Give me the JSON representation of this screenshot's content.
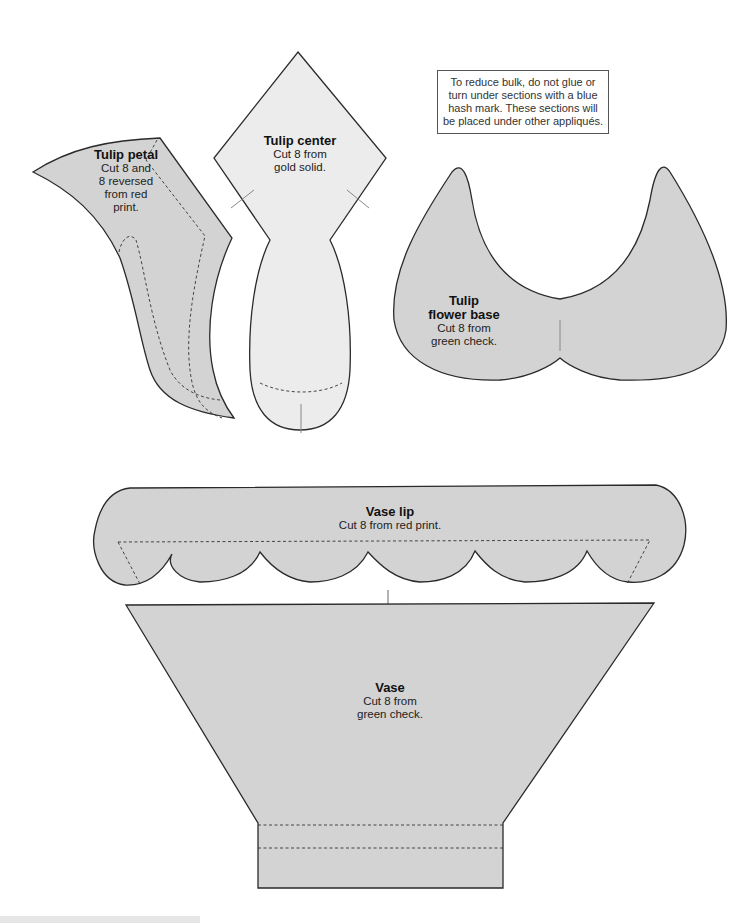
{
  "note": {
    "text": "To reduce bulk, do not glue or turn under sections with a blue hash mark. These sections will be placed under other appliqués."
  },
  "pieces": {
    "tulip_petal": {
      "title": "Tulip petal",
      "line1": "Cut 8 and",
      "line2": "8 reversed",
      "line3": "from red",
      "line4": "print."
    },
    "tulip_center": {
      "title": "Tulip center",
      "line1": "Cut 8 from",
      "line2": "gold solid."
    },
    "tulip_flower_base": {
      "title_line1": "Tulip",
      "title_line2": "flower base",
      "line1": "Cut 8 from",
      "line2": "green check."
    },
    "vase_lip": {
      "title": "Vase lip",
      "line1": "Cut 8 from red print."
    },
    "vase": {
      "title": "Vase",
      "line1": "Cut 8 from",
      "line2": "green check."
    }
  },
  "colors": {
    "gray_fill": "#d3d3d3",
    "light_fill": "#ececec",
    "outline": "#2a2a2a",
    "hash_mark": "#888888"
  }
}
